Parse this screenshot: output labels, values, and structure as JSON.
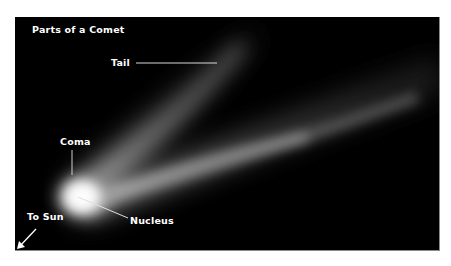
{
  "diagram": {
    "title": "Parts of a Comet",
    "background_color": "#000000",
    "label_color": "#ffffff",
    "labels": {
      "tail": "Tail",
      "coma": "Coma",
      "nucleus": "Nucleus",
      "to_sun": "To Sun"
    },
    "icons": {
      "sun_direction": "arrow-down-left-icon"
    }
  }
}
